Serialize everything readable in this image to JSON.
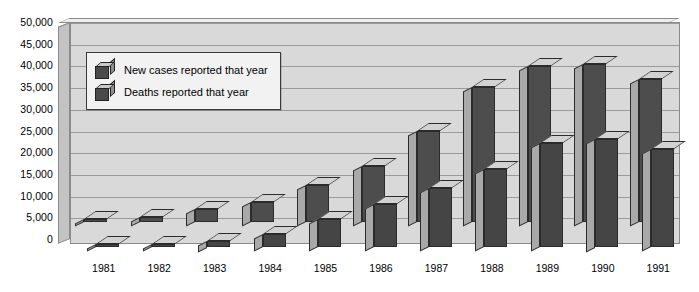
{
  "chart_data": {
    "type": "bar",
    "title": "",
    "subtitle": "",
    "xlabel": "",
    "ylabel": "",
    "ylim": [
      0,
      50000
    ],
    "ytick_step": 5000,
    "grid": true,
    "legend_position": "upper-left-inside",
    "style": "3d-clustered-bar",
    "categories": [
      "1981",
      "1982",
      "1983",
      "1984",
      "1985",
      "1986",
      "1987",
      "1988",
      "1989",
      "1990",
      "1991"
    ],
    "series": [
      {
        "name": "New cases reported that year",
        "values": [
          300,
          1200,
          3000,
          4500,
          8500,
          13000,
          21000,
          31000,
          36000,
          36500,
          33000
        ]
      },
      {
        "name": "Deaths reported that year",
        "values": [
          150,
          500,
          1500,
          3000,
          6500,
          10000,
          13500,
          18000,
          24000,
          25000,
          22500
        ]
      }
    ],
    "ytick_labels": [
      "0",
      "5,000",
      "10,000",
      "15,000",
      "20,000",
      "25,000",
      "30,000",
      "35,000",
      "40,000",
      "45,000",
      "50,000"
    ],
    "colors": {
      "new_cases": "#4d4d4d",
      "deaths": "#454545",
      "plot_background": "#d9d9d9",
      "gridline": "#9a9a9a",
      "bar_top": "#d2d2d2",
      "bar_side": "#a9a9a9",
      "legend_background": "#f2f2f2",
      "text": "#000000"
    }
  },
  "legend": {
    "items": [
      {
        "label": "New cases reported that year"
      },
      {
        "label": "Deaths reported that year"
      }
    ]
  }
}
